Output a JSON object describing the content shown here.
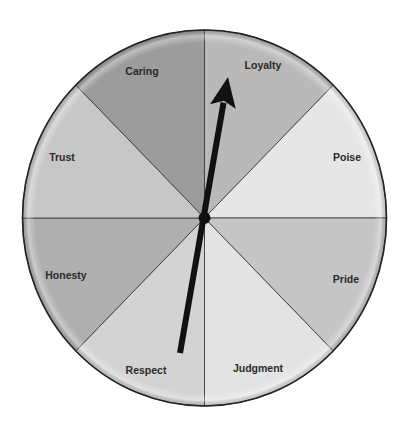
{
  "diagram": {
    "type": "spinner-wheel",
    "center": {
      "x": 204.5,
      "y": 218
    },
    "radius": {
      "rx": 182,
      "ry": 188
    },
    "segments": [
      {
        "label": "Loyalty",
        "start_deg": 0,
        "end_deg": 45,
        "color": "#b9b9b9",
        "label_pos": {
          "x": 263,
          "y": 66
        }
      },
      {
        "label": "Poise",
        "start_deg": 45,
        "end_deg": 90,
        "color": "#e6e6e6",
        "label_pos": {
          "x": 347,
          "y": 158
        }
      },
      {
        "label": "Pride",
        "start_deg": 90,
        "end_deg": 135,
        "color": "#c5c5c5",
        "label_pos": {
          "x": 346,
          "y": 280
        }
      },
      {
        "label": "Judgment",
        "start_deg": 135,
        "end_deg": 180,
        "color": "#e3e3e3",
        "label_pos": {
          "x": 258,
          "y": 369
        }
      },
      {
        "label": "Respect",
        "start_deg": 180,
        "end_deg": 225,
        "color": "#d3d3d3",
        "label_pos": {
          "x": 146,
          "y": 371
        }
      },
      {
        "label": "Honesty",
        "start_deg": 225,
        "end_deg": 270,
        "color": "#afafaf",
        "label_pos": {
          "x": 66,
          "y": 276
        }
      },
      {
        "label": "Trust",
        "start_deg": 270,
        "end_deg": 315,
        "color": "#c7c7c7",
        "label_pos": {
          "x": 62,
          "y": 158
        }
      },
      {
        "label": "Caring",
        "start_deg": 315,
        "end_deg": 360,
        "color": "#9c9c9c",
        "label_pos": {
          "x": 142,
          "y": 72
        }
      }
    ],
    "pointer": {
      "pointing_at": "Loyalty",
      "tip": {
        "x": 228,
        "y": 77
      },
      "tail": {
        "x": 180,
        "y": 353
      },
      "color": "#111111"
    },
    "hub": {
      "color": "#111111",
      "r": 6
    }
  }
}
